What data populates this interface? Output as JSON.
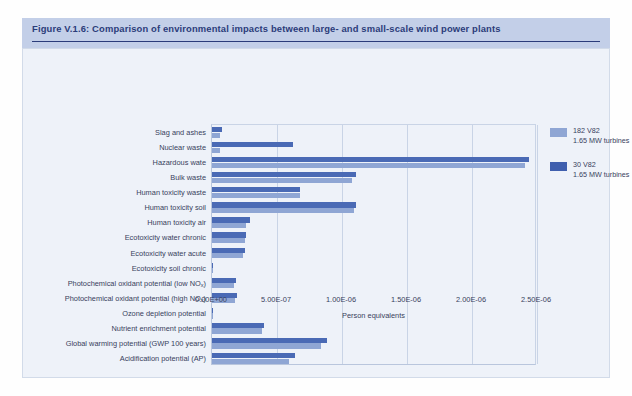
{
  "figure": {
    "title": "Figure V.1.6: Comparison of environmental impacts between large- and small-scale wind power plants",
    "source": "Source: Vestas Wind System A/S"
  },
  "legend": [
    {
      "name": "182 V82",
      "sub": "1.65 MW turbines",
      "color": "#8fa6d4"
    },
    {
      "name": "30 V82",
      "sub": "1.65 MW turbines",
      "color": "#3f5fae"
    }
  ],
  "chart_data": {
    "type": "bar",
    "orientation": "horizontal",
    "title": "Comparison of environmental impacts between large- and small-scale wind power plants",
    "xlabel": "Person equivalents",
    "ylabel": "",
    "xlim": [
      0,
      2.5e-06
    ],
    "xticks": [
      0,
      5e-07,
      1e-06,
      1.5e-06,
      2e-06,
      2.5e-06
    ],
    "xtick_labels": [
      "0.00E+00",
      "5.00E-07",
      "1.00E-06",
      "1.50E-06",
      "2.00E-06",
      "2.50E-06"
    ],
    "grid": "vertical",
    "legend_position": "right",
    "categories": [
      "Slag and ashes",
      "Nuclear waste",
      "Hazardous wate",
      "Bulk waste",
      "Human toxicity waste",
      "Human toxicity soil",
      "Human toxicity air",
      "Ecotoxicity water chronic",
      "Ecotoxicity water acute",
      "Ecotoxicity soil chronic",
      "Photochemical oxidant potential (low NOx)",
      "Photochemical oxidant potential (high NOx)",
      "Ozone depletion potential",
      "Nutrient enrichment potential",
      "Global warming potential (GWP 100 years)",
      "Acidification potential (AP)"
    ],
    "series": [
      {
        "name": "30 V82 1.65 MW turbines",
        "color": "#4a6ab5",
        "values": [
          7.7e-08,
          6.2e-07,
          2.44e-06,
          1.11e-06,
          6.8e-07,
          1.11e-06,
          2.95e-07,
          2.65e-07,
          2.55e-07,
          4e-09,
          1.85e-07,
          1.95e-07,
          3e-09,
          4e-07,
          8.85e-07,
          6.4e-07
        ]
      },
      {
        "name": "182 V82 1.65 MW turbines",
        "color": "#8fa6d4",
        "values": [
          6.2e-08,
          6.2e-08,
          2.41e-06,
          1.08e-06,
          6.8e-07,
          1.09e-06,
          2.6e-07,
          2.5e-07,
          2.4e-07,
          3e-09,
          1.7e-07,
          1.8e-07,
          2e-09,
          3.85e-07,
          8.4e-07,
          5.9e-07
        ]
      }
    ]
  }
}
